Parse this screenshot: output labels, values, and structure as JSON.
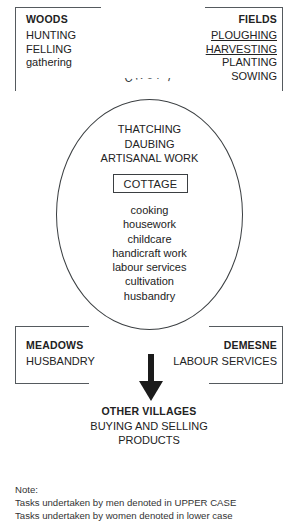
{
  "diagram": {
    "corners": {
      "woods": {
        "heading": "WOODS",
        "items": [
          {
            "text": "HUNTING",
            "underline": false
          },
          {
            "text": "FELLING",
            "underline": false
          },
          {
            "text": "gathering",
            "underline": false
          }
        ]
      },
      "fields": {
        "heading": "FIELDS",
        "items": [
          {
            "text": "PLOUGHING",
            "underline": true
          },
          {
            "text": "HARVESTING",
            "underline": true
          },
          {
            "text": "PLANTING",
            "underline": false
          },
          {
            "text": "SOWING",
            "underline": false
          }
        ]
      },
      "meadows": {
        "heading": "MEADOWS",
        "items": [
          {
            "text": "HUSBANDRY",
            "underline": false
          }
        ]
      },
      "demesne": {
        "heading": "DEMESNE",
        "items": [
          {
            "text": "LABOUR SERVICES",
            "underline": false
          }
        ]
      }
    },
    "croft": {
      "arc_label": "CROFT",
      "upper_tasks": [
        "THATCHING",
        "DAUBING",
        "ARTISANAL WORK"
      ],
      "cottage_label": "COTTAGE",
      "lower_tasks": [
        "cooking",
        "housework",
        "childcare",
        "handicraft work",
        "labour services",
        "cultivation",
        "husbandry"
      ]
    },
    "outflow": {
      "arrow": "down-arrow",
      "heading": "OTHER VILLAGES",
      "lines": [
        "BUYING AND SELLING",
        "PRODUCTS"
      ]
    },
    "note": {
      "label": "Note:",
      "lines": [
        "Tasks undertaken by men denoted in UPPER CASE",
        "Tasks undertaken by women denoted in lower case"
      ]
    },
    "colors": {
      "stroke": "#3b3f42",
      "bracket": "#555a5e",
      "text": "#222222",
      "note_text": "#333333",
      "background": "#ffffff"
    }
  }
}
